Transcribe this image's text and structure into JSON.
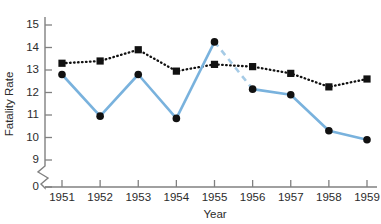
{
  "chart_data": {
    "type": "line",
    "title": "",
    "xlabel": "Year",
    "ylabel": "Fatality Rate",
    "categories": [
      "1951",
      "1952",
      "1953",
      "1954",
      "1955",
      "1956",
      "1957",
      "1958",
      "1959"
    ],
    "x": [
      1951,
      1952,
      1953,
      1954,
      1955,
      1956,
      1957,
      1958,
      1959
    ],
    "xlim": [
      1950.6,
      1959.4
    ],
    "ylim": [
      9,
      15
    ],
    "y_axis_break": true,
    "y_axis_break_note": "axis broken between 0 and 9",
    "y_ticks": [
      "15",
      "14",
      "13",
      "12",
      "11",
      "10",
      "9",
      "0"
    ],
    "y_tick_values": [
      15,
      14,
      13,
      12,
      11,
      10,
      9,
      0
    ],
    "x_ticks": [
      "1951",
      "1952",
      "1953",
      "1954",
      "1955",
      "1956",
      "1957",
      "1958",
      "1959"
    ],
    "grid": false,
    "legend": "none",
    "series": [
      {
        "name": "black-dotted-series",
        "marker": "square",
        "line_style": "dotted",
        "color": "#111111",
        "values": [
          13.3,
          13.4,
          13.9,
          12.95,
          13.25,
          13.15,
          12.85,
          12.25,
          12.6
        ]
      },
      {
        "name": "blue-solid-series",
        "marker": "circle",
        "line_style": "solid",
        "color": "#79b2dd",
        "dashed_segment": [
          1955,
          1956
        ],
        "dashed_segment_color": "#a6cbe6",
        "values": [
          12.8,
          10.95,
          12.8,
          10.85,
          14.25,
          12.15,
          11.9,
          10.3,
          9.9
        ]
      }
    ],
    "colors": {
      "blue_line": "#79b2dd",
      "blue_dashed": "#a6cbe6",
      "black_line": "#111111",
      "axis": "#808080",
      "text": "#2b2b2b",
      "background": "#ffffff"
    }
  }
}
